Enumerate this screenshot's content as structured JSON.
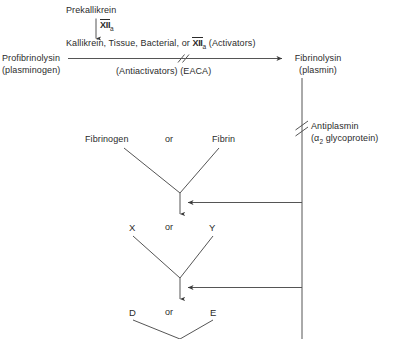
{
  "diagram": {
    "type": "flowchart",
    "line_color": "#555555",
    "text_color": "#2b2b2b",
    "background": "#ffffff"
  },
  "nodes": {
    "prekallikrein": "Prekallikrein",
    "factor_xiia_roman": "XII",
    "factor_xiia_sub": "a",
    "activators_pre": "Kallikrein, Tissue, Bacterial, or ",
    "activators_roman": "XII",
    "activators_sub": "a",
    "activators_post": " (Activators)",
    "antiactivators": "(Antiactivators) (EACA)",
    "profibrinolysin_line1": "Profibrinolysin",
    "profibrinolysin_line2": "(plasminogen)",
    "fibrinolysin_line1": "Fibrinolysin",
    "fibrinolysin_line2": "(plasmin)",
    "antiplasmin_line1": "Antiplasmin",
    "antiplasmin_line2_pre": "(α",
    "antiplasmin_line2_sub": "2",
    "antiplasmin_line2_post": " glycoprotein)",
    "fibrinogen": "Fibrinogen",
    "fibrin": "Fibrin",
    "or_1": "or",
    "fragment_x": "X",
    "fragment_y": "Y",
    "or_2": "or",
    "fragment_d": "D",
    "fragment_e": "E",
    "or_3": "or"
  }
}
